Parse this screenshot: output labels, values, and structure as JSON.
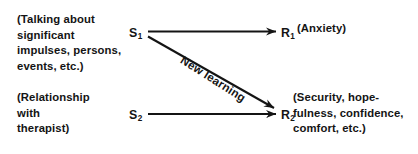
{
  "figure": {
    "type": "stimulus-response-diagram",
    "background_color": "#ffffff",
    "ink_color": "#141414"
  },
  "nodes": {
    "stimulus_1": {
      "label": "S",
      "subscript": "1"
    },
    "stimulus_2": {
      "label": "S",
      "subscript": "2"
    },
    "response_1": {
      "label": "R",
      "subscript": "1"
    },
    "response_2": {
      "label": "R",
      "subscript": "2"
    }
  },
  "descriptions": {
    "stimulus_1": "(Talking about\nsignificant\nimpulses, persons,\nevents, etc.)",
    "stimulus_2": "(Relationship\nwith\ntherapist)",
    "response_1": "(Anxiety)",
    "response_2": "(Security, hope-\nfulness, confidence,\ncomfort, etc.)"
  },
  "edges": {
    "s1_to_r1": {
      "label": "",
      "from": "stimulus_1",
      "to": "response_1"
    },
    "s2_to_r2": {
      "label": "",
      "from": "stimulus_2",
      "to": "response_2"
    },
    "s1_to_r2": {
      "label": "New learning",
      "from": "stimulus_1",
      "to": "response_2"
    }
  }
}
